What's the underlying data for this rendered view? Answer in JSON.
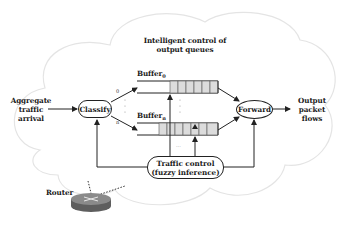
{
  "diagram": {
    "title_line1": "Intelligent control of",
    "title_line2": "output queues",
    "input": {
      "line1": "Aggregate",
      "line2": "traffic",
      "line3": "arrival"
    },
    "classify": "Classify",
    "forward": "Forward",
    "output": {
      "line1": "Output",
      "line2": "packet",
      "line3": "flows"
    },
    "buffer_top": {
      "label": "Buffer",
      "sub": "0"
    },
    "buffer_bottom": {
      "label": "Buffer",
      "sub": "n"
    },
    "branch_top_label": "0",
    "branch_bottom_label": "n",
    "traffic_control": {
      "line1": "Traffic control",
      "line2": "(fuzzy inference)"
    },
    "ellipsis": "...",
    "router_label": "Router",
    "colors": {
      "stroke": "#222222",
      "cloud": "#e6e6e6",
      "buffer_cell": "#dcdcdc",
      "router_top": "#8a8a8a",
      "router_side": "#5e5e5e"
    }
  }
}
